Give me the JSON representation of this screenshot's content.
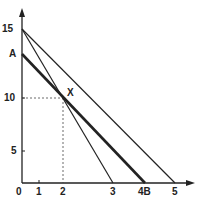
{
  "diagram": {
    "y_axis": {
      "ticks": [
        {
          "label": "0",
          "value": 0
        },
        {
          "label": "5",
          "value": 5
        },
        {
          "label": "10",
          "value": 10
        },
        {
          "label": "15",
          "value": 15
        }
      ],
      "point_label": "A"
    },
    "x_axis": {
      "ticks": [
        {
          "label": "1",
          "value": 1
        },
        {
          "label": "2",
          "value": 2
        },
        {
          "label": "3",
          "value": 3
        },
        {
          "label": "4B",
          "value": 4
        },
        {
          "label": "5",
          "value": 5
        }
      ]
    },
    "intersection_label": "X",
    "lines": [
      {
        "name": "line-15-3",
        "from": [
          0,
          15
        ],
        "to": [
          3,
          0
        ],
        "style": "thin"
      },
      {
        "name": "line-15-5",
        "from": [
          0,
          15
        ],
        "to": [
          5,
          0
        ],
        "style": "thin"
      },
      {
        "name": "line-A-B",
        "from": [
          0,
          "A"
        ],
        "to": [
          4,
          0
        ],
        "style": "thick"
      }
    ],
    "intersection": {
      "x": 2,
      "y": 10
    },
    "colors": {
      "ink": "#222222",
      "background": "#ffffff"
    }
  }
}
